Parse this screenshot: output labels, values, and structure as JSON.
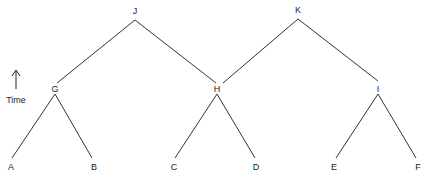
{
  "diagram": {
    "type": "tree",
    "axis_label": "Time",
    "axis_direction": "up",
    "nodes": [
      {
        "id": "J",
        "label": "J",
        "x": 135,
        "y": 14
      },
      {
        "id": "K",
        "label": "K",
        "x": 298,
        "y": 13
      },
      {
        "id": "G",
        "label": "G",
        "x": 55,
        "y": 92
      },
      {
        "id": "H",
        "label": "H",
        "x": 217,
        "y": 92
      },
      {
        "id": "I",
        "label": "I",
        "x": 378,
        "y": 92
      },
      {
        "id": "A",
        "label": "A",
        "x": 11,
        "y": 170
      },
      {
        "id": "B",
        "label": "B",
        "x": 94,
        "y": 170
      },
      {
        "id": "C",
        "label": "C",
        "x": 174,
        "y": 170
      },
      {
        "id": "D",
        "label": "D",
        "x": 256,
        "y": 170
      },
      {
        "id": "E",
        "label": "E",
        "x": 334,
        "y": 170
      },
      {
        "id": "F",
        "label": "F",
        "x": 418,
        "y": 170
      }
    ],
    "edges": [
      {
        "from": "J",
        "to": "G",
        "x1": 135,
        "y1": 20,
        "x2": 57,
        "y2": 83
      },
      {
        "from": "J",
        "to": "H",
        "x1": 135,
        "y1": 20,
        "x2": 216,
        "y2": 83
      },
      {
        "from": "K",
        "to": "H",
        "x1": 298,
        "y1": 19,
        "x2": 223,
        "y2": 83
      },
      {
        "from": "K",
        "to": "I",
        "x1": 298,
        "y1": 19,
        "x2": 378,
        "y2": 81
      },
      {
        "from": "G",
        "to": "A",
        "x1": 55,
        "y1": 94,
        "x2": 12,
        "y2": 158
      },
      {
        "from": "G",
        "to": "B",
        "x1": 55,
        "y1": 94,
        "x2": 92,
        "y2": 158
      },
      {
        "from": "H",
        "to": "C",
        "x1": 217,
        "y1": 94,
        "x2": 175,
        "y2": 158
      },
      {
        "from": "H",
        "to": "D",
        "x1": 217,
        "y1": 94,
        "x2": 255,
        "y2": 158
      },
      {
        "from": "I",
        "to": "E",
        "x1": 378,
        "y1": 94,
        "x2": 336,
        "y2": 158
      },
      {
        "from": "I",
        "to": "F",
        "x1": 378,
        "y1": 94,
        "x2": 416,
        "y2": 158
      }
    ]
  }
}
